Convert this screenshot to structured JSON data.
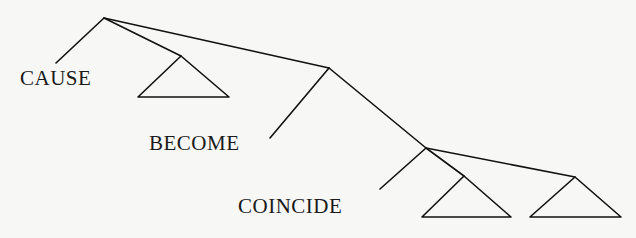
{
  "diagram": {
    "type": "syntax-tree",
    "labels": {
      "cause": "CAUSE",
      "become": "BECOME",
      "coincide": "COINCIDE"
    },
    "nodes": [
      {
        "id": "root",
        "x": 104,
        "y": 18
      },
      {
        "id": "node2",
        "x": 329,
        "y": 68
      },
      {
        "id": "node3",
        "x": 426,
        "y": 148
      }
    ],
    "leaves": [
      {
        "id": "cause-leaf",
        "label": "CAUSE",
        "parent": "root"
      },
      {
        "id": "triangle-1",
        "parent": "root"
      },
      {
        "id": "become-leaf",
        "label": "BECOME",
        "parent": "node2"
      },
      {
        "id": "coincide-leaf",
        "label": "COINCIDE",
        "parent": "node3"
      },
      {
        "id": "triangle-2",
        "parent": "node3"
      },
      {
        "id": "triangle-3",
        "parent": "node3"
      }
    ],
    "colors": {
      "line": "#111111",
      "text": "#1a1a1a",
      "background": "#f7f7f5"
    }
  }
}
